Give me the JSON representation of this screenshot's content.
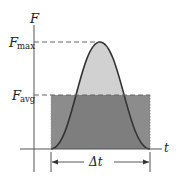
{
  "diagram": {
    "axes": {
      "y_label": "F",
      "x_label": "t"
    },
    "levels": {
      "max_label_main": "F",
      "max_label_sub": "max",
      "avg_label_main": "F",
      "avg_label_sub": "avg"
    },
    "interval_label": "Δt",
    "colors": {
      "curve_fill": "#c8c8c8",
      "rect_fill": "#8a8a8a",
      "overlap_fill": "#7a7a7a",
      "curve_stroke": "#333333",
      "axis": "#555555",
      "dash": "#666666"
    }
  }
}
